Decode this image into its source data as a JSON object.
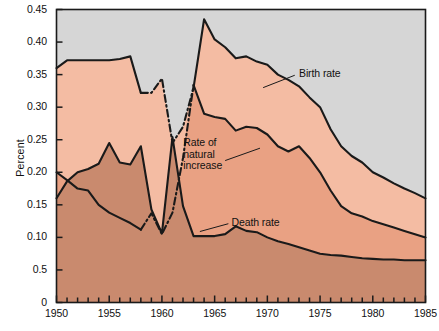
{
  "chart_data": {
    "type": "area",
    "title": "",
    "xlabel": "",
    "ylabel": "Percent",
    "xlim": [
      1950,
      1985
    ],
    "ylim": [
      0,
      0.45
    ],
    "grid": false,
    "legend_position": "inline-annotations",
    "x_tick_labels": [
      "1950",
      "1955",
      "1960",
      "1965",
      "1970",
      "1975",
      "1980",
      "1985"
    ],
    "x_tick_values": [
      1950,
      1955,
      1960,
      1965,
      1970,
      1975,
      1980,
      1985
    ],
    "x_minor_tick_step": 1,
    "y_tick_labels": [
      "0",
      "0.5",
      "0.10",
      "0.15",
      "0.20",
      "0.25",
      "0.30",
      "0.35",
      "0.40",
      "0.45"
    ],
    "y_tick_values": [
      0,
      0.05,
      0.1,
      0.15,
      0.2,
      0.25,
      0.3,
      0.35,
      0.4,
      0.45
    ],
    "annotations": [
      {
        "name": "birth-rate-label",
        "text": "Birth rate",
        "x": 1973.0,
        "y": 0.352
      },
      {
        "name": "rate-of-natural-increase-label",
        "text": "Rate of\nnatural\nincrease",
        "x": 1966.2,
        "y": 0.228
      },
      {
        "name": "death-rate-label",
        "text": "Death rate",
        "x": 1966.6,
        "y": 0.123
      }
    ],
    "x": [
      1950,
      1951,
      1952,
      1953,
      1954,
      1955,
      1956,
      1957,
      1958,
      1959,
      1960,
      1961,
      1962,
      1963,
      1964,
      1965,
      1966,
      1967,
      1968,
      1969,
      1970,
      1971,
      1972,
      1973,
      1974,
      1975,
      1976,
      1977,
      1978,
      1979,
      1980,
      1981,
      1982,
      1983,
      1984,
      1985
    ],
    "series": [
      {
        "name": "Birth rate",
        "color": "#1a1a1a",
        "fill_above_color": "#D6D6D6",
        "fill_color": "#F4BCA3",
        "dashed_range": [
          1958,
          1963
        ],
        "values": [
          0.36,
          0.372,
          0.372,
          0.372,
          0.372,
          0.372,
          0.374,
          0.378,
          0.322,
          0.322,
          0.344,
          0.245,
          0.27,
          0.33,
          0.435,
          0.404,
          0.392,
          0.375,
          0.378,
          0.37,
          0.365,
          0.35,
          0.342,
          0.332,
          0.315,
          0.3,
          0.266,
          0.24,
          0.225,
          0.215,
          0.2,
          0.192,
          0.183,
          0.175,
          0.168,
          0.16
        ]
      },
      {
        "name": "Rate of natural increase",
        "color": "#1a1a1a",
        "fill_color": "#E9A183",
        "dashed_range": [
          1958,
          1963
        ],
        "values": [
          0.2,
          0.188,
          0.175,
          0.172,
          0.15,
          0.138,
          0.13,
          0.122,
          0.112,
          0.137,
          0.105,
          0.138,
          0.222,
          0.334,
          0.29,
          0.285,
          0.282,
          0.264,
          0.27,
          0.268,
          0.258,
          0.24,
          0.232,
          0.24,
          0.222,
          0.2,
          0.172,
          0.148,
          0.137,
          0.132,
          0.125,
          0.12,
          0.115,
          0.11,
          0.105,
          0.1
        ]
      },
      {
        "name": "Death rate",
        "color": "#1a1a1a",
        "fill_color": "#C98A6E",
        "values": [
          0.16,
          0.186,
          0.2,
          0.205,
          0.213,
          0.245,
          0.215,
          0.212,
          0.24,
          0.143,
          0.106,
          0.254,
          0.148,
          0.102,
          0.102,
          0.102,
          0.105,
          0.117,
          0.11,
          0.108,
          0.1,
          0.094,
          0.09,
          0.085,
          0.08,
          0.075,
          0.073,
          0.072,
          0.07,
          0.068,
          0.067,
          0.066,
          0.066,
          0.065,
          0.065,
          0.065
        ]
      }
    ]
  }
}
